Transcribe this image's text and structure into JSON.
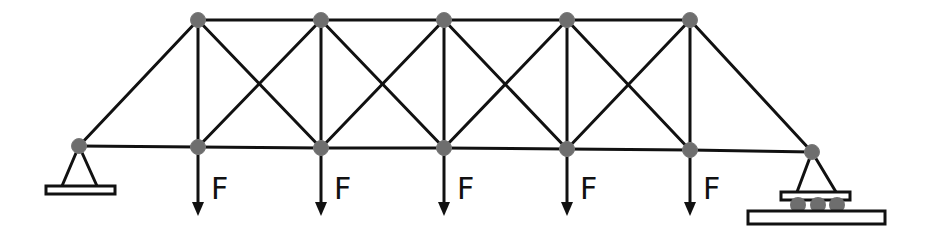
{
  "diagram": {
    "type": "truss",
    "colors": {
      "member": "#111111",
      "node": "#6e6e6e",
      "background": "#ffffff"
    },
    "supports": {
      "left": {
        "kind": "pin",
        "x": 79,
        "y": 146
      },
      "right": {
        "kind": "roller",
        "x": 812,
        "y": 152
      }
    },
    "top_chord_nodes": [
      {
        "x": 198,
        "y": 20
      },
      {
        "x": 321,
        "y": 20
      },
      {
        "x": 444,
        "y": 20
      },
      {
        "x": 567,
        "y": 20
      },
      {
        "x": 690,
        "y": 20
      }
    ],
    "bottom_chord_nodes": [
      {
        "x": 198,
        "y": 147
      },
      {
        "x": 321,
        "y": 148
      },
      {
        "x": 444,
        "y": 148
      },
      {
        "x": 567,
        "y": 149
      },
      {
        "x": 690,
        "y": 150
      }
    ],
    "loads": [
      {
        "label": "F",
        "node": 0
      },
      {
        "label": "F",
        "node": 1
      },
      {
        "label": "F",
        "node": 2
      },
      {
        "label": "F",
        "node": 3
      },
      {
        "label": "F",
        "node": 4
      }
    ]
  }
}
